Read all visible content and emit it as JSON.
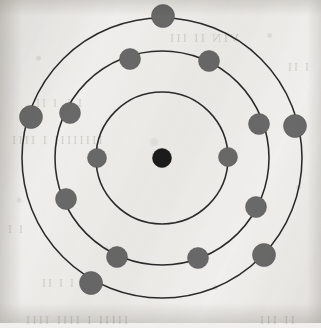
{
  "figure": {
    "element_name": "Sulfur",
    "atomic_number": 16,
    "medium": "scanned textbook page",
    "background_color": "#f2f1ef",
    "ring_color": "#2b2b2b",
    "electron_color": "#6a6a6a",
    "nucleus_color": "#1c1c1c",
    "center": {
      "x": 162,
      "y": 158
    }
  },
  "nucleus": {
    "label": "nucleus",
    "cx": 162,
    "cy": 158,
    "r": 9.5
  },
  "shells": [
    {
      "name": "K",
      "index": 1,
      "radius": 66,
      "electron_count": 2,
      "electrons": [
        {
          "cx": 97,
          "cy": 158,
          "r": 9.5
        },
        {
          "cx": 228,
          "cy": 157,
          "r": 9.5
        }
      ]
    },
    {
      "name": "L",
      "index": 2,
      "radius": 107,
      "electron_count": 8,
      "electrons": [
        {
          "cx": 130,
          "cy": 59,
          "r": 10.5
        },
        {
          "cx": 209,
          "cy": 61,
          "r": 10.5
        },
        {
          "cx": 70,
          "cy": 113,
          "r": 10.5
        },
        {
          "cx": 259,
          "cy": 124,
          "r": 10.5
        },
        {
          "cx": 66,
          "cy": 199,
          "r": 10.5
        },
        {
          "cx": 256,
          "cy": 207,
          "r": 10.5
        },
        {
          "cx": 117,
          "cy": 257,
          "r": 10.5
        },
        {
          "cx": 198,
          "cy": 258,
          "r": 10.5
        }
      ]
    },
    {
      "name": "M",
      "index": 3,
      "radius": 140,
      "electron_count": 6,
      "electrons": [
        {
          "cx": 163,
          "cy": 16,
          "r": 11.5
        },
        {
          "cx": 31,
          "cy": 117,
          "r": 11.5
        },
        {
          "cx": 295,
          "cy": 126,
          "r": 11.5
        },
        {
          "cx": 264,
          "cy": 255,
          "r": 11.5
        },
        {
          "cx": 91,
          "cy": 283,
          "r": 11.5
        },
        {
          "cx": 23,
          "cy": 188,
          "r": 0
        }
      ]
    }
  ],
  "chart_data": {
    "type": "scatter",
    "xlabel": "",
    "ylabel": "",
    "categories": [
      "K",
      "L",
      "M"
    ],
    "values": [
      2,
      8,
      6
    ],
    "series": [
      {
        "name": "electrons per shell",
        "values": [
          2,
          8,
          6
        ]
      },
      {
        "name": "shell radius (px)",
        "values": [
          66,
          107,
          140
        ]
      }
    ],
    "annotations": [
      "nucleus at center",
      "total electrons: 16"
    ],
    "legend_position": "none",
    "grid": false
  },
  "bleed_text": [
    {
      "text": "VIN II III",
      "x": 168,
      "y": 30,
      "size": 13
    },
    {
      "text": "I L I II",
      "x": 34,
      "y": 96,
      "size": 12
    },
    {
      "text": "IIIIIIII  I IIII",
      "x": 10,
      "y": 132,
      "size": 13
    },
    {
      "text": "I I",
      "x": 6,
      "y": 222,
      "size": 12
    },
    {
      "text": "I I II",
      "x": 40,
      "y": 276,
      "size": 12
    },
    {
      "text": "IIIII I IIII IIII",
      "x": 24,
      "y": 312,
      "size": 13
    },
    {
      "text": "II III",
      "x": 258,
      "y": 312,
      "size": 13
    },
    {
      "text": "I II",
      "x": 286,
      "y": 60,
      "size": 12
    }
  ]
}
